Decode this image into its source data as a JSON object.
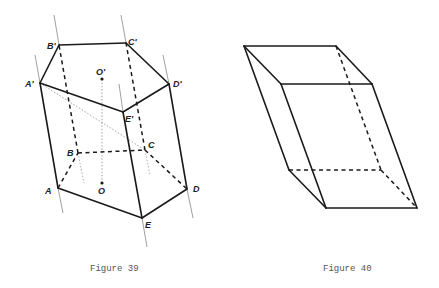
{
  "figures": [
    {
      "caption": "Figure 39",
      "caption_pos": [
        90,
        271
      ],
      "vertices": {
        "A": [
          58,
          188
        ],
        "B": [
          78,
          153
        ],
        "C": [
          145,
          150
        ],
        "D": [
          187,
          189
        ],
        "E": [
          142,
          218
        ],
        "A'": [
          40,
          83
        ],
        "B'": [
          59,
          45
        ],
        "C'": [
          126,
          43
        ],
        "D'": [
          169,
          84
        ],
        "E'": [
          123,
          112
        ],
        "O": [
          102,
          183
        ],
        "O'": [
          102,
          79
        ]
      },
      "labels": [
        {
          "text": "A",
          "x": 45,
          "y": 194
        },
        {
          "text": "B",
          "x": 67,
          "y": 156
        },
        {
          "text": "C",
          "x": 148,
          "y": 148
        },
        {
          "text": "D",
          "x": 193,
          "y": 192
        },
        {
          "text": "E",
          "x": 145,
          "y": 228
        },
        {
          "text": "O",
          "x": 98,
          "y": 194
        },
        {
          "text": "A'",
          "x": 25,
          "y": 87
        },
        {
          "text": "B'",
          "x": 47,
          "y": 49
        },
        {
          "text": "C'",
          "x": 128,
          "y": 45
        },
        {
          "text": "D'",
          "x": 173,
          "y": 87
        },
        {
          "text": "E'",
          "x": 125,
          "y": 122
        },
        {
          "text": "O'",
          "x": 96,
          "y": 75
        }
      ],
      "solid_edges": [
        [
          "A'",
          "B'"
        ],
        [
          "B'",
          "C'"
        ],
        [
          "C'",
          "D'"
        ],
        [
          "D'",
          "E'"
        ],
        [
          "E'",
          "A'"
        ],
        [
          "A",
          "A'"
        ],
        [
          "E",
          "E'"
        ],
        [
          "D",
          "D'"
        ],
        [
          "A",
          "E"
        ],
        [
          "E",
          "D"
        ]
      ],
      "dashed_edges": [
        [
          "B",
          "B'"
        ],
        [
          "C",
          "C'"
        ],
        [
          "A",
          "B"
        ],
        [
          "B",
          "C"
        ],
        [
          "C",
          "D"
        ]
      ],
      "dotted_lines": [
        [
          "A'",
          "C"
        ],
        [
          "O",
          "O'"
        ]
      ],
      "extension_lines": [
        [
          [
            35,
            55
          ],
          [
            40,
            83
          ]
        ],
        [
          [
            54,
            15
          ],
          [
            59,
            45
          ]
        ],
        [
          [
            121,
            15
          ],
          [
            126,
            43
          ]
        ],
        [
          [
            163,
            55
          ],
          [
            169,
            84
          ]
        ],
        [
          [
            119,
            84
          ],
          [
            123,
            112
          ]
        ],
        [
          [
            58,
            188
          ],
          [
            63,
            213
          ]
        ],
        [
          [
            142,
            218
          ],
          [
            147,
            247
          ]
        ],
        [
          [
            187,
            189
          ],
          [
            193,
            218
          ]
        ]
      ],
      "hidden_extensions": [
        [
          [
            78,
            153
          ],
          [
            84,
            183
          ]
        ],
        [
          [
            145,
            150
          ],
          [
            150,
            175
          ]
        ]
      ]
    },
    {
      "caption": "Figure 40",
      "caption_pos": [
        323,
        271
      ],
      "vertices": {
        "back_top_left": [
          244,
          46
        ],
        "back_top_right": [
          336,
          46
        ],
        "front_top_left": [
          281,
          84
        ],
        "front_top_right": [
          372,
          84
        ],
        "back_bottom_left": [
          289,
          170
        ],
        "back_bottom_right": [
          381,
          170
        ],
        "front_bottom_left": [
          326,
          208
        ],
        "front_bottom_right": [
          417,
          208
        ]
      },
      "solid_edges": [
        [
          "back_top_left",
          "back_top_right"
        ],
        [
          "back_top_left",
          "front_top_left"
        ],
        [
          "front_top_left",
          "front_top_right"
        ],
        [
          "back_top_right",
          "front_top_right"
        ],
        [
          "back_top_left",
          "back_bottom_left"
        ],
        [
          "front_top_left",
          "front_bottom_left"
        ],
        [
          "front_top_right",
          "front_bottom_right"
        ],
        [
          "front_bottom_left",
          "front_bottom_right"
        ],
        [
          "back_bottom_left",
          "front_bottom_left"
        ]
      ],
      "dashed_edges": [
        [
          "back_top_right",
          "back_bottom_right"
        ],
        [
          "back_bottom_left",
          "back_bottom_right"
        ],
        [
          "back_bottom_right",
          "front_bottom_right"
        ]
      ]
    }
  ]
}
